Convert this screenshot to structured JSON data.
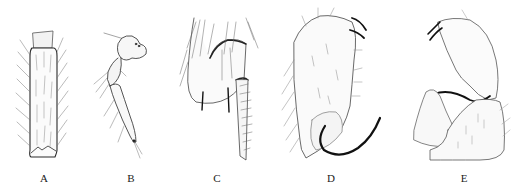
{
  "figure": {
    "panels": [
      {
        "label": "A",
        "x": 44
      },
      {
        "label": "B",
        "x": 131
      },
      {
        "label": "C",
        "x": 217
      },
      {
        "label": "D",
        "x": 331
      },
      {
        "label": "E",
        "x": 464
      }
    ]
  },
  "colors": {
    "ink": "#2a2a2a",
    "light_ink": "#777777",
    "dark_spine": "#111111",
    "background": "#ffffff"
  }
}
